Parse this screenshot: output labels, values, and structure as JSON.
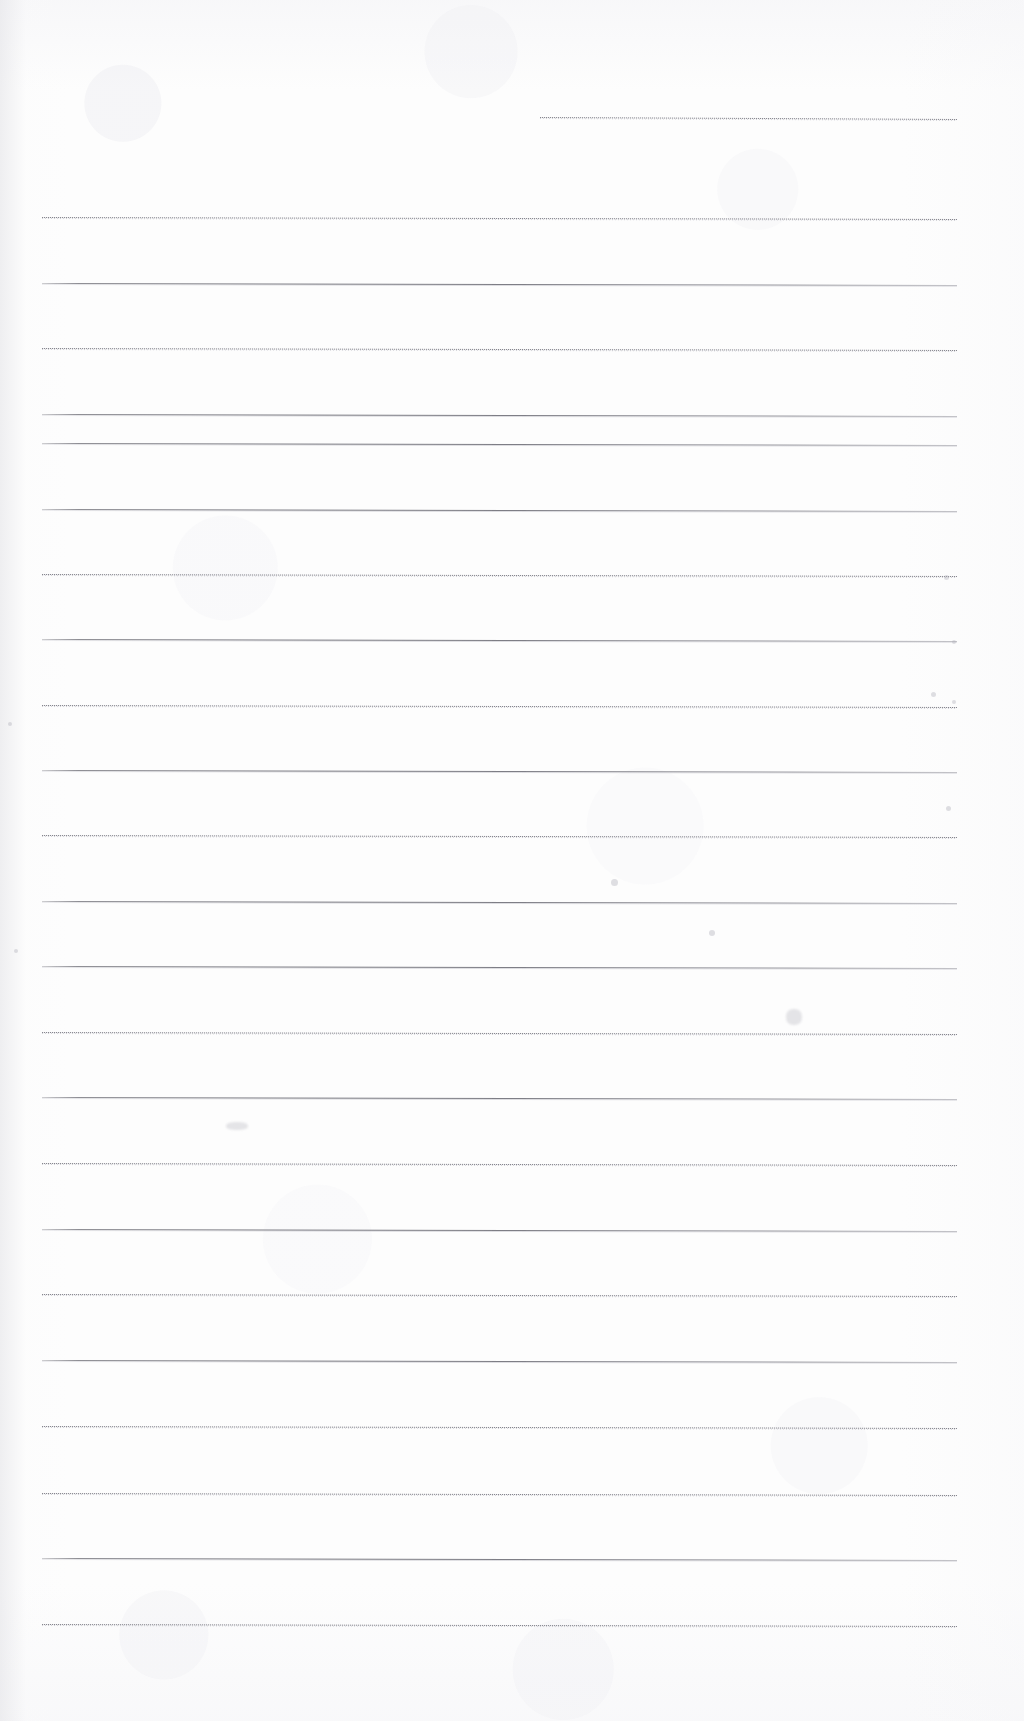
{
  "document": {
    "kind": "scanned-ruled-notebook-page",
    "title": "Blank ruled notebook page",
    "page_width": 1024,
    "page_height": 1721,
    "background_color": "#fdfdfd",
    "content_text": "",
    "handwriting_present": "none"
  },
  "ruling": {
    "left_margin_x": 42,
    "right_margin_x": 957,
    "line_spacing_px": 65.5,
    "first_full_line_y": 217,
    "last_full_line_y": 1624,
    "full_line_count": 22,
    "slant_px": 2,
    "ink_color_solid": "#70707a",
    "ink_color_dotted": "#8a8a92",
    "style_pattern": "alternating solid / dotted"
  },
  "partial_top_line": {
    "label": "short top rule",
    "x_start": 540,
    "x_end": 957,
    "y": 117,
    "style": "dotted"
  },
  "lines": [
    {
      "y": 217,
      "x1": 42,
      "x2": 957,
      "style": "dotted"
    },
    {
      "y": 283,
      "x1": 42,
      "x2": 957,
      "style": "solid"
    },
    {
      "y": 348,
      "x1": 42,
      "x2": 957,
      "style": "dotted"
    },
    {
      "y": 414,
      "x1": 42,
      "x2": 957,
      "style": "solid"
    },
    {
      "y": 443,
      "x1": 42,
      "x2": 957,
      "style": "solid"
    },
    {
      "y": 509,
      "x1": 42,
      "x2": 957,
      "style": "solid"
    },
    {
      "y": 574,
      "x1": 42,
      "x2": 957,
      "style": "dotted"
    },
    {
      "y": 639,
      "x1": 42,
      "x2": 957,
      "style": "solid"
    },
    {
      "y": 705,
      "x1": 42,
      "x2": 957,
      "style": "dotted"
    },
    {
      "y": 770,
      "x1": 42,
      "x2": 957,
      "style": "solid"
    },
    {
      "y": 835,
      "x1": 42,
      "x2": 957,
      "style": "dotted"
    },
    {
      "y": 901,
      "x1": 42,
      "x2": 957,
      "style": "solid"
    },
    {
      "y": 966,
      "x1": 42,
      "x2": 957,
      "style": "solid"
    },
    {
      "y": 1032,
      "x1": 42,
      "x2": 957,
      "style": "dotted"
    },
    {
      "y": 1097,
      "x1": 42,
      "x2": 957,
      "style": "solid"
    },
    {
      "y": 1163,
      "x1": 42,
      "x2": 957,
      "style": "dotted"
    },
    {
      "y": 1229,
      "x1": 42,
      "x2": 957,
      "style": "solid"
    },
    {
      "y": 1294,
      "x1": 42,
      "x2": 957,
      "style": "dotted"
    },
    {
      "y": 1360,
      "x1": 42,
      "x2": 957,
      "style": "solid"
    },
    {
      "y": 1426,
      "x1": 42,
      "x2": 957,
      "style": "dotted"
    },
    {
      "y": 1493,
      "x1": 42,
      "x2": 957,
      "style": "dotted"
    },
    {
      "y": 1558,
      "x1": 42,
      "x2": 957,
      "style": "solid"
    },
    {
      "y": 1624,
      "x1": 42,
      "x2": 957,
      "style": "dotted"
    }
  ],
  "artifacts": {
    "description": "faint scanner specks and a light pencil smudge",
    "specks": [
      {
        "x": 944,
        "y": 575,
        "size": 5
      },
      {
        "x": 952,
        "y": 640,
        "size": 4
      },
      {
        "x": 931,
        "y": 692,
        "size": 5
      },
      {
        "x": 952,
        "y": 700,
        "size": 4
      },
      {
        "x": 946,
        "y": 806,
        "size": 5
      },
      {
        "x": 8,
        "y": 722,
        "size": 4
      },
      {
        "x": 14,
        "y": 949,
        "size": 4
      },
      {
        "x": 611,
        "y": 879,
        "size": 7
      },
      {
        "x": 709,
        "y": 930,
        "size": 6
      }
    ],
    "smudges": [
      {
        "x": 786,
        "y": 1009,
        "w": 16,
        "h": 16
      },
      {
        "x": 226,
        "y": 1122,
        "w": 22,
        "h": 8
      }
    ]
  }
}
